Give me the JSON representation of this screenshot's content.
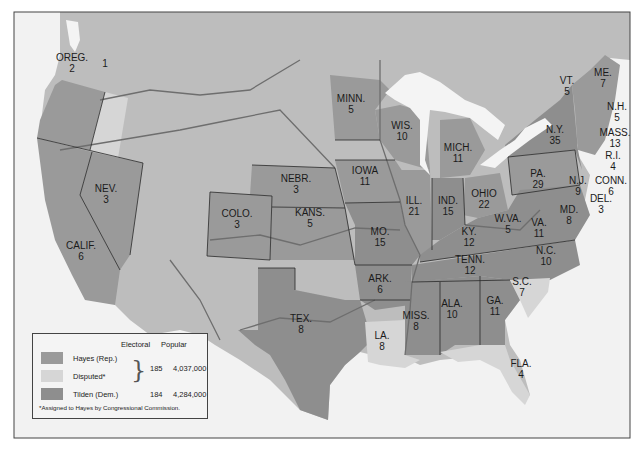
{
  "colors": {
    "hayes": "#9a9a9a",
    "disputed": "#d6d6d6",
    "tilden": "#8e8e8e",
    "land_other": "#bdbdbd",
    "water": "#f2f2f2",
    "lakes": "#f4f4f4",
    "rivers": "#6e6e6e",
    "borders": "#2a2a2a"
  },
  "legend": {
    "col_electoral": "Electoral",
    "col_popular": "Popular",
    "items": [
      {
        "label": "Hayes (Rep.)",
        "color": "#9a9a9a"
      },
      {
        "label": "Disputed*",
        "color": "#d6d6d6"
      },
      {
        "label": "Tilden (Dem.)",
        "color": "#8e8e8e"
      }
    ],
    "hayes_electoral": "185",
    "hayes_popular": "4,037,000",
    "tilden_electoral": "184",
    "tilden_popular": "4,284,000",
    "footnote": "*Assigned to Hayes by Congressional Commission."
  },
  "states": [
    {
      "abbr": "OREG.",
      "votes": "2",
      "party": "hayes",
      "x": 72,
      "y": 62
    },
    {
      "abbr": "",
      "votes": "1",
      "party": "disputed",
      "x": 105,
      "y": 68
    },
    {
      "abbr": "NEV.",
      "votes": "3",
      "party": "hayes",
      "x": 106,
      "y": 193
    },
    {
      "abbr": "CALIF.",
      "votes": "6",
      "party": "hayes",
      "x": 81,
      "y": 250
    },
    {
      "abbr": "COLO.",
      "votes": "3",
      "party": "hayes",
      "x": 237,
      "y": 218
    },
    {
      "abbr": "NEBR.",
      "votes": "3",
      "party": "hayes",
      "x": 296,
      "y": 183
    },
    {
      "abbr": "KANS.",
      "votes": "5",
      "party": "hayes",
      "x": 310,
      "y": 217
    },
    {
      "abbr": "MINN.",
      "votes": "5",
      "party": "hayes",
      "x": 351,
      "y": 103
    },
    {
      "abbr": "IOWA",
      "votes": "11",
      "party": "hayes",
      "x": 365,
      "y": 175
    },
    {
      "abbr": "WIS.",
      "votes": "10",
      "party": "hayes",
      "x": 402,
      "y": 130
    },
    {
      "abbr": "MICH.",
      "votes": "11",
      "party": "hayes",
      "x": 458,
      "y": 152
    },
    {
      "abbr": "ILL.",
      "votes": "21",
      "party": "hayes",
      "x": 414,
      "y": 205
    },
    {
      "abbr": "IND.",
      "votes": "15",
      "party": "tilden",
      "x": 448,
      "y": 205
    },
    {
      "abbr": "OHIO",
      "votes": "22",
      "party": "hayes",
      "x": 484,
      "y": 198
    },
    {
      "abbr": "MO.",
      "votes": "15",
      "party": "tilden",
      "x": 380,
      "y": 236
    },
    {
      "abbr": "KY.",
      "votes": "12",
      "party": "tilden",
      "x": 469,
      "y": 236
    },
    {
      "abbr": "W.VA.",
      "votes": "5",
      "party": "tilden",
      "x": 508,
      "y": 223
    },
    {
      "abbr": "VA.",
      "votes": "11",
      "party": "tilden",
      "x": 539,
      "y": 227
    },
    {
      "abbr": "ARK.",
      "votes": "6",
      "party": "tilden",
      "x": 380,
      "y": 283
    },
    {
      "abbr": "TENN.",
      "votes": "12",
      "party": "tilden",
      "x": 470,
      "y": 264
    },
    {
      "abbr": "N.C.",
      "votes": "10",
      "party": "tilden",
      "x": 546,
      "y": 255
    },
    {
      "abbr": "S.C.",
      "votes": "7",
      "party": "disputed",
      "x": 522,
      "y": 286
    },
    {
      "abbr": "TEX.",
      "votes": "8",
      "party": "tilden",
      "x": 301,
      "y": 323
    },
    {
      "abbr": "LA.",
      "votes": "8",
      "party": "disputed",
      "x": 382,
      "y": 340
    },
    {
      "abbr": "MISS.",
      "votes": "8",
      "party": "tilden",
      "x": 416,
      "y": 320
    },
    {
      "abbr": "ALA.",
      "votes": "10",
      "party": "tilden",
      "x": 452,
      "y": 308
    },
    {
      "abbr": "GA.",
      "votes": "11",
      "party": "tilden",
      "x": 495,
      "y": 305
    },
    {
      "abbr": "FLA.",
      "votes": "4",
      "party": "disputed",
      "x": 521,
      "y": 368
    },
    {
      "abbr": "N.Y.",
      "votes": "35",
      "party": "tilden",
      "x": 555,
      "y": 134
    },
    {
      "abbr": "PA.",
      "votes": "29",
      "party": "hayes",
      "x": 538,
      "y": 178
    },
    {
      "abbr": "N.J.",
      "votes": "9",
      "party": "tilden",
      "x": 578,
      "y": 185
    },
    {
      "abbr": "DEL.",
      "votes": "3",
      "party": "tilden",
      "x": 601,
      "y": 203
    },
    {
      "abbr": "MD.",
      "votes": "8",
      "party": "tilden",
      "x": 569,
      "y": 214
    },
    {
      "abbr": "VT.",
      "votes": "5",
      "party": "hayes",
      "x": 567,
      "y": 85
    },
    {
      "abbr": "ME.",
      "votes": "7",
      "party": "hayes",
      "x": 603,
      "y": 77
    },
    {
      "abbr": "N.H.",
      "votes": "5",
      "party": "hayes",
      "x": 617,
      "y": 111
    },
    {
      "abbr": "MASS.",
      "votes": "13",
      "party": "hayes",
      "x": 615,
      "y": 137
    },
    {
      "abbr": "R.I.",
      "votes": "4",
      "party": "hayes",
      "x": 613,
      "y": 160
    },
    {
      "abbr": "CONN.",
      "votes": "6",
      "party": "tilden",
      "x": 611,
      "y": 185
    }
  ]
}
